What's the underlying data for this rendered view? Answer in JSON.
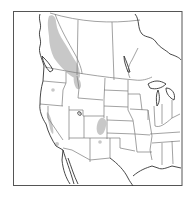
{
  "map": {
    "type": "species-range-map",
    "region": "Western and Central North America",
    "colors": {
      "background": "#ffffff",
      "frame": "#555555",
      "boundary": "#7a7a7a",
      "coastline": "#333333",
      "range_fill": "#c8c8c8"
    },
    "range_areas": [
      {
        "name": "northern-rockies-range",
        "description": "British Columbia / Alberta Rocky Mountains into northern Idaho/Montana"
      },
      {
        "name": "oregon-patch",
        "description": "Small patch in Oregon"
      },
      {
        "name": "sierra-nevada-range",
        "description": "Sierra Nevada, California"
      },
      {
        "name": "southern-california-patch",
        "description": "Southern California mountains"
      },
      {
        "name": "colorado-rockies-range",
        "description": "Colorado Rocky Mountains"
      },
      {
        "name": "new-mexico-patch",
        "description": "Northern New Mexico"
      }
    ]
  }
}
